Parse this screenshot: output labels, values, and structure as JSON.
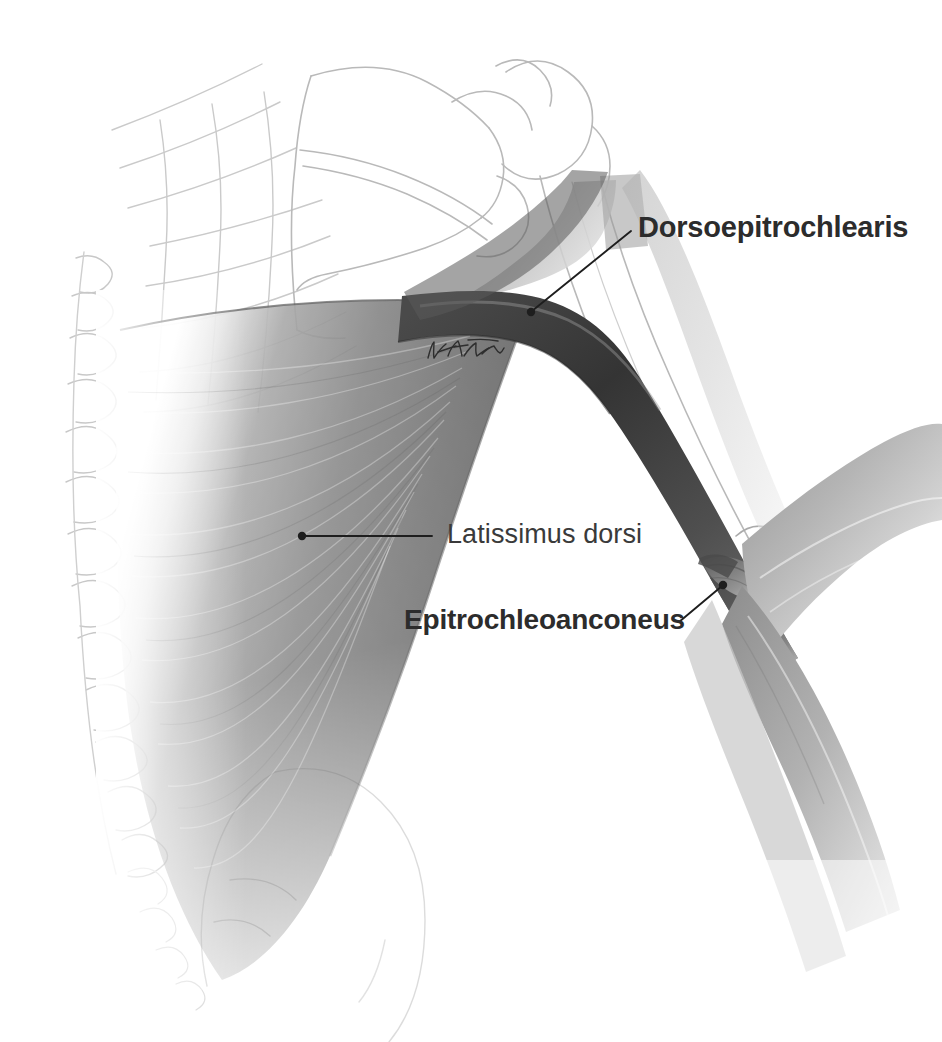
{
  "figure": {
    "kind": "anatomical-illustration",
    "medium": "graphite pencil drawing",
    "background_color": "#ffffff",
    "width": 942,
    "height": 1042
  },
  "labels": [
    {
      "id": "dorsoepitrochlearis",
      "text": "Dorsoepitrochlearis",
      "weight": "bold",
      "color": "#2c2c2c",
      "font_size_px": 29,
      "text_x": 638,
      "text_y": 213,
      "leader": {
        "from_x": 631,
        "from_y": 231,
        "to_x": 531,
        "to_y": 312,
        "dot_x": 531,
        "dot_y": 312
      }
    },
    {
      "id": "latissimus-dorsi",
      "text": "Latissimus dorsi",
      "weight": "regular",
      "color": "#3a3a3a",
      "font_size_px": 27,
      "text_x": 447,
      "text_y": 521,
      "leader": {
        "from_x": 432,
        "from_y": 536,
        "to_x": 302,
        "to_y": 536,
        "dot_x": 302,
        "dot_y": 536
      }
    },
    {
      "id": "epitrochleoanconeus",
      "text": "Epitrochleoanconeus",
      "weight": "bold",
      "color": "#2c2c2c",
      "font_size_px": 28,
      "text_x": 404,
      "text_y": 606,
      "leader": {
        "from_x": 679,
        "from_y": 622,
        "to_x": 723,
        "to_y": 585,
        "dot_x": 723,
        "dot_y": 585
      }
    }
  ],
  "artist_signature": {
    "present": true,
    "legible": false,
    "x": 424,
    "y": 336,
    "width": 84,
    "height": 30
  },
  "structures": [
    {
      "name": "vertebral-column",
      "rendering": "faint pencil outline",
      "note": "row of spinous processes along the left margin"
    },
    {
      "name": "rib-cage",
      "rendering": "faint pencil outline",
      "note": "upper ribs visible behind the scapula"
    },
    {
      "name": "scapula",
      "rendering": "faint pencil outline",
      "note": "blade, spine and acromion at upper centre"
    },
    {
      "name": "humerus",
      "rendering": "faint pencil outline",
      "note": "head at shoulder, shaft descending to the elbow"
    },
    {
      "name": "ulna-olecranon",
      "rendering": "faint pencil outline",
      "note": "elbow joint at lower right"
    },
    {
      "name": "ilium",
      "rendering": "faint pencil outline",
      "note": "pelvic crest at lower centre"
    },
    {
      "name": "latissimus-dorsi",
      "rendering": "dark graphite shading",
      "note": "large fan-shaped sheet filling the left half"
    },
    {
      "name": "dorsoepitrochlearis",
      "rendering": "darkest graphite shading",
      "note": "arched band from latissimus tendon to the medial epicondyle"
    },
    {
      "name": "epitrochleoanconeus",
      "rendering": "mid-grey shading",
      "note": "small muscle bridging the medial epicondyle and olecranon"
    },
    {
      "name": "forearm-flexors",
      "rendering": "mid-grey shading",
      "note": "muscle mass of the forearm at lower right"
    }
  ],
  "palette": {
    "paper": "#ffffff",
    "pencil_outline": "#bdbdbd",
    "muscle_light": "#c9c9c9",
    "muscle_mid": "#8e8e8e",
    "muscle_dark": "#595959",
    "muscle_darkest": "#3a3a3a",
    "leader_line": "#1e1e1e",
    "text": "#2c2c2c"
  }
}
